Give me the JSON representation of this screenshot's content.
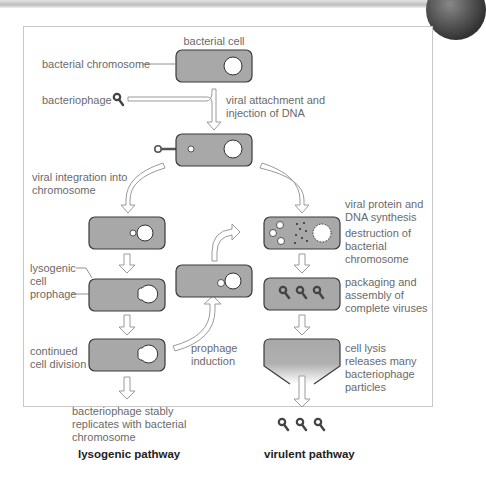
{
  "figure": {
    "colors": {
      "cell_fill": "#a8a8a8",
      "cell_stroke": "#3a3a3a",
      "text": "#6a6a6a",
      "arrow_stroke": "#9a9a9a",
      "frame_border": "#c8c8c8"
    }
  },
  "labels": {
    "bacterial_cell": "bacterial cell",
    "bacterial_chromosome": "bacterial chromosome",
    "bacteriophage": "bacteriophage",
    "viral_attachment_1": "viral attachment and",
    "viral_attachment_2": "injection of DNA",
    "viral_integration_1": "viral integration into",
    "viral_integration_2": "chromosome",
    "viral_protein_1": "viral protein and",
    "viral_protein_2": "DNA synthesis",
    "destruction_1": "destruction of",
    "destruction_2": "bacterial",
    "destruction_3": "chromosome",
    "lysogenic_cell_1": "lysogenic",
    "lysogenic_cell_2": "cell",
    "prophage": "prophage",
    "packaging_1": "packaging and",
    "packaging_2": "assembly of",
    "packaging_3": "complete viruses",
    "continued_1": "continued",
    "continued_2": "cell division",
    "induction_1": "prophage",
    "induction_2": "induction",
    "lysis_1": "cell lysis",
    "lysis_2": "releases many",
    "lysis_3": "bacteriophage",
    "lysis_4": "particles",
    "stable_1": "bacteriophage stably",
    "stable_2": "replicates with bacterial",
    "stable_3": "chromosome"
  },
  "pathways": {
    "lysogenic": "lysogenic pathway",
    "virulent": "virulent pathway"
  }
}
